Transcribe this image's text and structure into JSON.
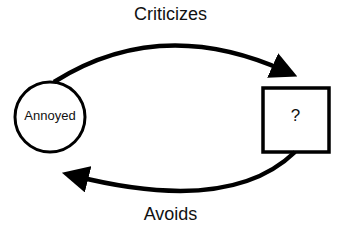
{
  "diagram": {
    "nodes": [
      {
        "id": "annoyed",
        "shape": "circle",
        "label": "Annoyed"
      },
      {
        "id": "unknown",
        "shape": "square",
        "label": "?"
      }
    ],
    "edges": [
      {
        "from": "annoyed",
        "to": "unknown",
        "label": "Criticizes",
        "position": "top"
      },
      {
        "from": "unknown",
        "to": "annoyed",
        "label": "Avoids",
        "position": "bottom"
      }
    ],
    "colors": {
      "stroke": "#000000",
      "background": "#ffffff"
    }
  }
}
